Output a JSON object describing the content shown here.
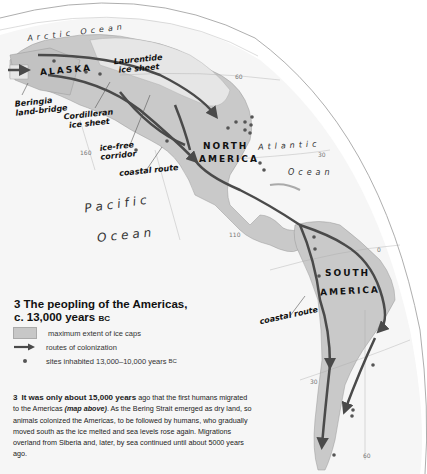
{
  "map": {
    "oceans": {
      "arctic": "Arctic Ocean",
      "atlantic_1": "Atlantic",
      "atlantic_2": "Ocean",
      "pacific_1": "Pacific",
      "pacific_2": "Ocean"
    },
    "regions": {
      "alaska": "ALASKA",
      "north_america_1": "NORTH",
      "north_america_2": "AMERICA",
      "south_america_1": "SOUTH",
      "south_america_2": "AMERICA"
    },
    "annotations": {
      "laurentide_1": "Laurentide",
      "laurentide_2": "ice sheet",
      "beringia_1": "Beringia",
      "beringia_2": "land-bridge",
      "cordilleran_1": "Cordilleran",
      "cordilleran_2": "ice sheet",
      "icefree_1": "ice-free",
      "icefree_2": "corridor",
      "coastal_route_north": "coastal route",
      "coastal_route_south": "coastal route"
    },
    "graticule": {
      "lat_60": "60",
      "lat_30_north": "30",
      "lat_0": "0",
      "lat_30_south": "30",
      "lon_160": "160",
      "lon_110": "110",
      "lon_60": "60"
    },
    "colors": {
      "land": "#c9c9c9",
      "ice": "#e4e4e4",
      "route": "#4a4a4a",
      "site": "#555555",
      "sea": "#f3f3f3"
    }
  },
  "title": {
    "line1": "3 The peopling of the Americas,",
    "line2": "c. 13,000 years",
    "era": "BC"
  },
  "legend": {
    "items": [
      {
        "icon": "gray-swatch",
        "label": "maximum extent of ice caps"
      },
      {
        "icon": "arrow",
        "label": "routes of colonization"
      },
      {
        "icon": "dot",
        "label": "sites inhabited 13,000–10,000 years",
        "suffix": "BC"
      }
    ]
  },
  "caption": {
    "number": "3",
    "lead_bold": "It was only about 15,000 years",
    "text_1": " ago that the first humans migrated to the Americas ",
    "ref_italic": "(map above)",
    "text_2": ". As the Bering Strait emerged as dry land, so animals colonized the Americas, to be followed by humans, who gradually moved south as the ice melted and sea levels rose again. Migrations overland from Siberia and, later, by sea continued until about 5000 years ago."
  }
}
